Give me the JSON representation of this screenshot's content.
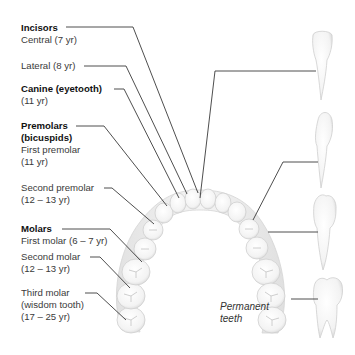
{
  "diagram": {
    "caption": [
      "Permanent",
      "teeth"
    ],
    "groups": [
      {
        "name": "Incisors",
        "entries": [
          {
            "label": "Central (7 yr)"
          },
          {
            "label": "Lateral (8 yr)"
          }
        ]
      },
      {
        "name": "Canine (eyetooth)",
        "entries": [
          {
            "label": "(11 yr)"
          }
        ]
      },
      {
        "name": "Premolars (bicuspids)",
        "name_lines": [
          "Premolars",
          "(bicuspids)"
        ],
        "entries": [
          {
            "label": "First premolar",
            "age": "(11 yr)"
          },
          {
            "label": "Second premolar",
            "age": "(12 – 13 yr)"
          }
        ]
      },
      {
        "name": "Molars",
        "entries": [
          {
            "label": "First molar (6 – 7 yr)"
          },
          {
            "label": "Second molar",
            "age": "(12 – 13 yr)"
          },
          {
            "label": "Third molar",
            "sub": "(wisdom tooth)",
            "age": "(17 – 25 yr)"
          }
        ]
      }
    ],
    "side_teeth": [
      "incisor-profile",
      "canine-profile",
      "premolar-profile",
      "molar-profile"
    ],
    "colors": {
      "leader_line": "#3a3a3a",
      "tooth_fill": "#f7f7f7",
      "tooth_shade": "#dcdcdc",
      "heading_text": "#111111",
      "body_text": "#3a3a3a"
    }
  }
}
